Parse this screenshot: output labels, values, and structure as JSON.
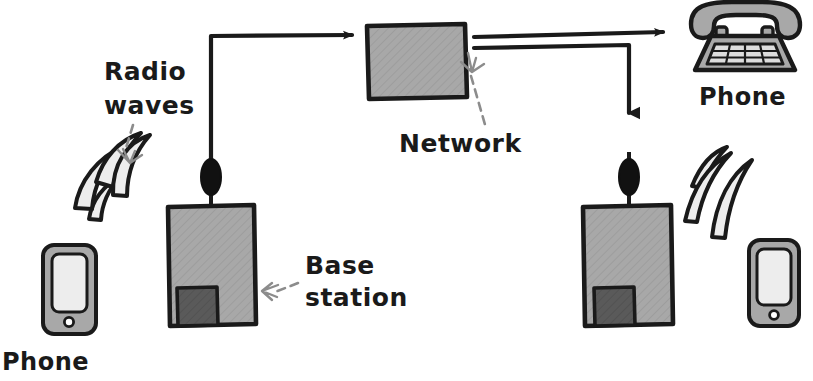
{
  "diagram": {
    "background_color": "#ffffff",
    "ink_color": "#1a1a1a",
    "body_gray": "#a8a8a8",
    "dark_gray": "#5a5a5a",
    "light_gray": "#e8e8e8",
    "screen_gray": "#ededed",
    "annotation_gray": "#8c8c8c"
  },
  "labels": {
    "radio_waves": "Radio\nwaves",
    "radio_waves_line1": "Radio",
    "radio_waves_line2": "waves",
    "base_station_line1": "Base",
    "base_station_line2": "station",
    "network": "Network",
    "phone_left": "Phone",
    "phone_right": "Phone"
  },
  "nodes": [
    {
      "id": "mobile-phone-left",
      "type": "mobile-phone",
      "label": "Phone",
      "side": "left"
    },
    {
      "id": "base-station-left",
      "type": "base-station",
      "label": "Base station",
      "side": "left"
    },
    {
      "id": "network-box",
      "type": "network",
      "label": "Network"
    },
    {
      "id": "base-station-right",
      "type": "base-station",
      "label": "Base station",
      "side": "right"
    },
    {
      "id": "mobile-phone-right",
      "type": "mobile-phone",
      "label": "Phone",
      "side": "right"
    },
    {
      "id": "desk-phone",
      "type": "landline-phone",
      "label": "Phone"
    }
  ],
  "connections": [
    {
      "id": "left-base-to-network",
      "from": "base-station-left",
      "to": "network-box",
      "style": "solid-arrow"
    },
    {
      "id": "network-to-desk-phone",
      "from": "network-box",
      "to": "desk-phone",
      "style": "solid-arrow"
    },
    {
      "id": "network-to-right-base",
      "from": "network-box",
      "to": "base-station-right",
      "style": "solid-arrow"
    },
    {
      "id": "radio-left",
      "from": "mobile-phone-left",
      "to": "base-station-left",
      "style": "radio-waves"
    },
    {
      "id": "radio-right",
      "from": "base-station-right",
      "to": "mobile-phone-right",
      "style": "radio-waves"
    }
  ],
  "annotations": [
    {
      "id": "radio-waves-annotation",
      "text": "Radio waves",
      "arrow": "dashed-down-right"
    },
    {
      "id": "base-station-annotation",
      "text": "Base station",
      "arrow": "dashed-left"
    },
    {
      "id": "network-annotation",
      "text": "Network",
      "arrow": "dashed-up-right"
    }
  ]
}
